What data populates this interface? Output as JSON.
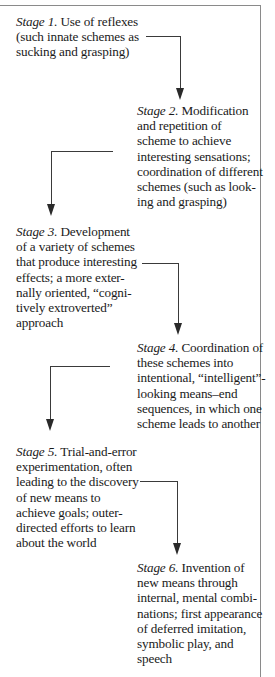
{
  "diagram": {
    "type": "flow",
    "direction": "zigzag top-to-bottom",
    "stages": [
      {
        "label": "Stage 1.",
        "lines": [
          "Use of reflexes",
          "(such innate schemes as",
          "sucking and grasping)"
        ]
      },
      {
        "label": "Stage 2.",
        "lines": [
          "Modification",
          "and repetition of",
          "scheme to achieve",
          "interesting sensations;",
          "coordination of different",
          "schemes (such as look-",
          "ing and grasping)"
        ]
      },
      {
        "label": "Stage 3.",
        "lines": [
          "Development",
          "of a variety of schemes",
          "that produce interesting",
          "effects; a more exter-",
          "nally oriented, “cogni-",
          "tively extroverted”",
          "approach"
        ]
      },
      {
        "label": "Stage 4.",
        "lines": [
          "Coordination of",
          "these schemes into",
          "intentional, “intelligent”-",
          "looking means–end",
          "sequences, in which one",
          "scheme leads to another"
        ]
      },
      {
        "label": "Stage 5.",
        "lines": [
          "Trial-and-error",
          "experimentation, often",
          "leading to the discovery",
          "of new means to",
          "achieve goals; outer-",
          "directed efforts to learn",
          "about the world"
        ]
      },
      {
        "label": "Stage 6.",
        "lines": [
          "Invention of",
          "new means through",
          "internal, mental combi-",
          "nations; first appearance",
          "of deferred imitation,",
          "symbolic play, and",
          "speech"
        ]
      }
    ],
    "connectors": [
      {
        "from": "Stage 1",
        "to": "Stage 2"
      },
      {
        "from": "Stage 2",
        "to": "Stage 3"
      },
      {
        "from": "Stage 3",
        "to": "Stage 4"
      },
      {
        "from": "Stage 4",
        "to": "Stage 5"
      },
      {
        "from": "Stage 5",
        "to": "Stage 6"
      }
    ],
    "colors": {
      "text": "#1a1a1a",
      "lines": "#3a3a3a",
      "frame": "#8a8a8a",
      "background": "#ffffff"
    }
  }
}
